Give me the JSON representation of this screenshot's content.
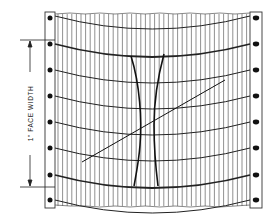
{
  "diagram": {
    "dimension_label": "1\" FACE WIDTH",
    "colors": {
      "ink": "#1a1a1a",
      "grid": "#333333",
      "background": "#ffffff"
    },
    "sprocket_holes": {
      "left_x": 50,
      "right_x": 256,
      "y_positions": [
        18,
        44,
        70,
        96,
        122,
        148,
        175,
        200
      ]
    },
    "face_width_span": {
      "top_y": 40,
      "bottom_y": 187
    }
  }
}
